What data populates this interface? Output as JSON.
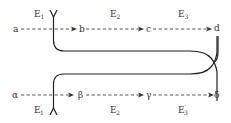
{
  "diagram": {
    "top_chain": {
      "nodes": [
        "a",
        "b",
        "c",
        "d"
      ],
      "edge_labels": [
        {
          "main": "E",
          "sub": "1",
          "prime": ""
        },
        {
          "main": "E",
          "sub": "2",
          "prime": ""
        },
        {
          "main": "E",
          "sub": "3",
          "prime": ""
        }
      ]
    },
    "bottom_chain": {
      "nodes": [
        "α",
        "β",
        "γ",
        "δ"
      ],
      "edge_labels": [
        {
          "main": "E",
          "sub": "1",
          "prime": "′"
        },
        {
          "main": "E",
          "sub": "2",
          "prime": "′"
        },
        {
          "main": "E",
          "sub": "3",
          "prime": "′"
        }
      ]
    },
    "colors": {
      "line": "#222222",
      "text": "#333333",
      "background": "#ffffff"
    }
  }
}
